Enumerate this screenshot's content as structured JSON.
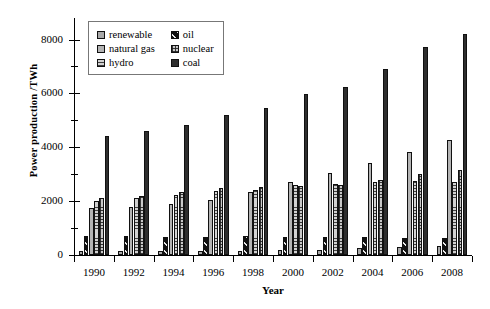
{
  "chart_data": {
    "type": "bar",
    "title": "",
    "xlabel": "Year",
    "ylabel": "Power production /TWh",
    "categories": [
      "1990",
      "1992",
      "1994",
      "1996",
      "1998",
      "2000",
      "2002",
      "2004",
      "2006",
      "2008"
    ],
    "ylim": [
      0,
      8800
    ],
    "yticks": [
      0,
      2000,
      4000,
      6000,
      8000
    ],
    "yticklabels": [
      "0",
      "2000",
      "4000",
      "6000",
      "8000"
    ],
    "yminorticks": [
      1000,
      3000,
      5000,
      7000
    ],
    "grid": false,
    "legend_position": "upper-left-inside",
    "series": [
      {
        "name": "renewable",
        "values": [
          160,
          150,
          160,
          150,
          150,
          180,
          200,
          250,
          280,
          350
        ]
      },
      {
        "name": "oil",
        "values": [
          700,
          700,
          680,
          670,
          700,
          660,
          660,
          660,
          620,
          620
        ]
      },
      {
        "name": "natural gas",
        "values": [
          1730,
          1780,
          1890,
          2040,
          2330,
          2720,
          3060,
          3430,
          3830,
          4280
        ]
      },
      {
        "name": "hydro",
        "values": [
          1990,
          2110,
          2230,
          2380,
          2430,
          2590,
          2650,
          2720,
          2760,
          2700
        ]
      },
      {
        "name": "nuclear",
        "values": [
          2130,
          2180,
          2330,
          2470,
          2540,
          2580,
          2600,
          2780,
          3010,
          3170
        ]
      },
      {
        "name": "coal",
        "values": [
          4410,
          4590,
          4830,
          5200,
          5450,
          5980,
          6250,
          6900,
          7720,
          8220
        ]
      }
    ]
  },
  "legend": {
    "entries": [
      {
        "label": "renewable",
        "swatch": "swatch-renewable-icon",
        "fill": "f-renewable",
        "color": "#a8a8a8"
      },
      {
        "label": "oil",
        "swatch": "swatch-oil-icon",
        "fill": "f-oil",
        "color": "#111111"
      },
      {
        "label": "natural gas",
        "swatch": "swatch-natural-gas-icon",
        "fill": "f-natural",
        "color": "#b4b4b4"
      },
      {
        "label": "nuclear",
        "swatch": "swatch-nuclear-icon",
        "fill": "f-nuclear",
        "color": "#c9c9c9"
      },
      {
        "label": "hydro",
        "swatch": "swatch-hydro-icon",
        "fill": "f-hydro",
        "color": "#d2d2d2"
      },
      {
        "label": "coal",
        "swatch": "swatch-coal-icon",
        "fill": "f-coal",
        "color": "#2e2e2e"
      }
    ]
  }
}
